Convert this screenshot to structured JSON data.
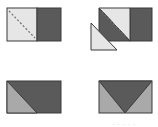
{
  "diagram": {
    "colors": {
      "light": "#e6e6e6",
      "medium": "#a9a9a9",
      "dark": "#5a5a5a",
      "outline": "#3a3a3a",
      "dash": "#6e6e6e"
    },
    "panels": [
      {
        "id": "step-1",
        "label": "Light square joined to dark square with dashed diagonal sewing line"
      },
      {
        "id": "step-2",
        "label": "Corner trimmed along diagonal; cut-off light triangle shown below left"
      },
      {
        "id": "step-3",
        "label": "Dark rectangle with lighter half-triangle at left"
      },
      {
        "id": "step-4",
        "label": "Flying-geese unit: dark center triangle with light side triangles"
      }
    ],
    "caption": "· · ·  · ·"
  }
}
